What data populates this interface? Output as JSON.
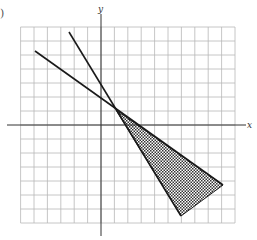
{
  "figure": {
    "part_label": ")",
    "x_axis_label": "x",
    "y_axis_label": "y",
    "colors": {
      "grid": "#b8b8b8",
      "axis": "#333333",
      "line": "#1a1a1a",
      "shade": "#333333"
    }
  },
  "chart_data": {
    "type": "diagram",
    "title": "",
    "grid": {
      "x_range": [
        -6,
        10
      ],
      "y_range": [
        -7,
        7
      ],
      "grid_on": true
    },
    "axes": {
      "xlabel": "x",
      "ylabel": "y"
    },
    "lines": [
      {
        "name": "line-shallow",
        "from": [
          -5,
          5.3
        ],
        "to": [
          9,
          -4.3
        ]
      },
      {
        "name": "line-steep",
        "from": [
          -2.4,
          6.6
        ],
        "to": [
          6,
          -6.5
        ]
      }
    ],
    "intersection": [
      1,
      1
    ],
    "shaded_region": {
      "vertices": [
        [
          1,
          1
        ],
        [
          9,
          -4.3
        ],
        [
          6,
          -6.5
        ]
      ],
      "pattern": "crosshatch"
    }
  }
}
